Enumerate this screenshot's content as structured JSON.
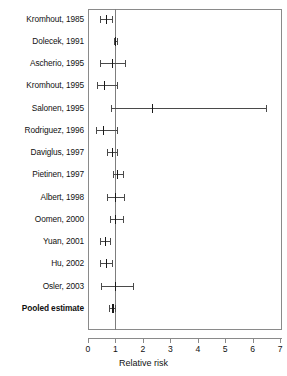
{
  "chart_data": {
    "type": "forest",
    "title": "",
    "xlabel": "Relative risk",
    "ylabel": "",
    "xlim": [
      0,
      7
    ],
    "xticks": [
      0,
      1,
      2,
      3,
      4,
      5,
      6,
      7
    ],
    "xticklabels": [
      "0",
      "1",
      "2",
      "3",
      "4",
      "5",
      "6",
      "7"
    ],
    "reference_line": 1,
    "grid": false,
    "legend": "none",
    "categories": [
      "Kromhout, 1985",
      "Dolecek, 1991",
      "Ascherio, 1995",
      "Kromhout, 1995",
      "Salonen, 1995",
      "Rodriguez, 1996",
      "Daviglus, 1997",
      "Pietinen, 1997",
      "Albert, 1998",
      "Oomen, 2000",
      "Yuan, 2001",
      "Hu, 2002",
      "Osler, 2003",
      "Pooled estimate"
    ],
    "series": [
      {
        "name": "Relative risk (95% CI)",
        "points": [
          {
            "label": "Kromhout, 1985",
            "estimate": 0.65,
            "ci_low": 0.44,
            "ci_high": 0.88,
            "pooled": false
          },
          {
            "label": "Dolecek, 1991",
            "estimate": 1.0,
            "ci_low": 0.96,
            "ci_high": 1.04,
            "pooled": false
          },
          {
            "label": "Ascherio, 1995",
            "estimate": 0.87,
            "ci_low": 0.44,
            "ci_high": 1.35,
            "pooled": false
          },
          {
            "label": "Kromhout, 1995",
            "estimate": 0.59,
            "ci_low": 0.33,
            "ci_high": 1.06,
            "pooled": false
          },
          {
            "label": "Salonen, 1995",
            "estimate": 2.33,
            "ci_low": 0.84,
            "ci_high": 6.5,
            "pooled": false
          },
          {
            "label": "Rodriguez, 1996",
            "estimate": 0.54,
            "ci_low": 0.29,
            "ci_high": 1.04,
            "pooled": false
          },
          {
            "label": "Daviglus, 1997",
            "estimate": 0.88,
            "ci_low": 0.69,
            "ci_high": 1.06,
            "pooled": false
          },
          {
            "label": "Pietinen, 1997",
            "estimate": 1.06,
            "ci_low": 0.92,
            "ci_high": 1.28,
            "pooled": false
          },
          {
            "label": "Albert, 1998",
            "estimate": 0.98,
            "ci_low": 0.71,
            "ci_high": 1.31,
            "pooled": false
          },
          {
            "label": "Oomen, 2000",
            "estimate": 1.0,
            "ci_low": 0.79,
            "ci_high": 1.27,
            "pooled": false
          },
          {
            "label": "Yuan, 2001",
            "estimate": 0.62,
            "ci_low": 0.44,
            "ci_high": 0.81,
            "pooled": false
          },
          {
            "label": "Hu, 2002",
            "estimate": 0.66,
            "ci_low": 0.45,
            "ci_high": 0.88,
            "pooled": false
          },
          {
            "label": "Osler, 2003",
            "estimate": 1.0,
            "ci_low": 0.48,
            "ci_high": 1.65,
            "pooled": false
          },
          {
            "label": "Pooled estimate",
            "estimate": 0.86,
            "ci_low": 0.77,
            "ci_high": 1.0,
            "pooled": true
          }
        ]
      }
    ]
  },
  "axis": {
    "x_title": "Relative risk",
    "tick_0": "0",
    "tick_1": "1",
    "tick_2": "2",
    "tick_3": "3",
    "tick_4": "4",
    "tick_5": "5",
    "tick_6": "6",
    "tick_7": "7"
  },
  "labels": {
    "l0": "Kromhout, 1985",
    "l1": "Dolecek, 1991",
    "l2": "Ascherio, 1995",
    "l3": "Kromhout, 1995",
    "l4": "Salonen, 1995",
    "l5": "Rodriguez, 1996",
    "l6": "Daviglus, 1997",
    "l7": "Pietinen, 1997",
    "l8": "Albert, 1998",
    "l9": "Oomen, 2000",
    "l10": "Yuan, 2001",
    "l11": "Hu, 2002",
    "l12": "Osler, 2003",
    "l13": "Pooled estimate"
  },
  "colors": {
    "frame": "#8a8a8a",
    "reference_line": "#7d7d7d",
    "interval": "#4a4a4a",
    "marker": "#1a1a1a",
    "text": "#111111",
    "background": "#ffffff"
  }
}
